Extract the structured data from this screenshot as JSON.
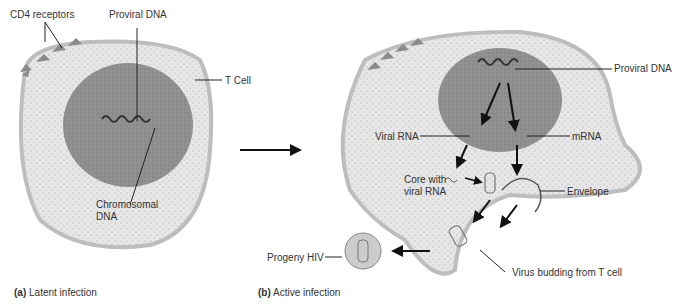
{
  "panel_a": {
    "caption_letter": "(a)",
    "caption_text": "Latent infection",
    "labels": {
      "cd4": "CD4 receptors",
      "proviral": "Proviral DNA",
      "tcell": "T Cell",
      "chromosomal_1": "Chromosomal",
      "chromosomal_2": "DNA"
    }
  },
  "panel_b": {
    "caption_letter": "(b)",
    "caption_text": "Active infection",
    "labels": {
      "proviral": "Proviral DNA",
      "viral_rna": "Viral RNA",
      "mrna": "mRNA",
      "core_1": "Core with",
      "core_2": "viral RNA",
      "envelope": "Envelope",
      "progeny": "Progeny HIV",
      "budding": "Virus budding from T cell"
    }
  },
  "colors": {
    "membrane": "#bdbdbd",
    "cytoplasm": "#e6e6e6",
    "nucleus": "#8f8f8f",
    "text": "#333333"
  }
}
